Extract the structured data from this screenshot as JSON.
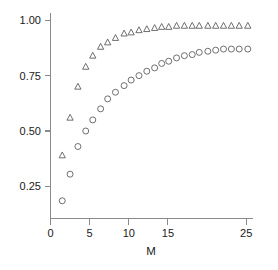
{
  "chart_data": {
    "type": "scatter",
    "title": "",
    "subtitle": "",
    "xlabel": "M",
    "ylabel": "",
    "xlim": [
      0,
      25.8
    ],
    "ylim": [
      0.105,
      1.035
    ],
    "grid": false,
    "legend": "none",
    "background_color": "#ffffff",
    "axis_color": "#8a8a8a",
    "marker_color": "#5f5f5f",
    "xticks": [
      0,
      5,
      10,
      15,
      25
    ],
    "xticklabels": [
      "0",
      "5",
      "10",
      "15",
      "25"
    ],
    "yticks": [
      0.25,
      0.5,
      0.75,
      1.0
    ],
    "yticklabels": [
      "0.25",
      "0.50",
      "0.75",
      "1.00"
    ],
    "x": [
      1.5,
      2.5,
      3.5,
      4.5,
      5.4,
      6.4,
      7.3,
      8.3,
      9.4,
      10.3,
      11.3,
      12.3,
      13.3,
      14.2,
      15.1,
      16.1,
      17.1,
      18.1,
      19.0,
      20.1,
      21.1,
      22.1,
      23.1,
      24.1,
      25.2
    ],
    "series": [
      {
        "name": "triangle-series",
        "marker": "triangle",
        "values": [
          0.39,
          0.56,
          0.7,
          0.79,
          0.84,
          0.88,
          0.9,
          0.92,
          0.94,
          0.945,
          0.955,
          0.96,
          0.965,
          0.97,
          0.97,
          0.975,
          0.975,
          0.975,
          0.975,
          0.975,
          0.975,
          0.975,
          0.975,
          0.975,
          0.975
        ]
      },
      {
        "name": "circle-series",
        "marker": "circle",
        "values": [
          0.185,
          0.305,
          0.43,
          0.5,
          0.55,
          0.6,
          0.645,
          0.675,
          0.705,
          0.73,
          0.75,
          0.77,
          0.785,
          0.805,
          0.815,
          0.83,
          0.84,
          0.845,
          0.855,
          0.86,
          0.865,
          0.87,
          0.87,
          0.87,
          0.87
        ]
      }
    ]
  },
  "figure": {
    "axis_title_x": "M"
  }
}
